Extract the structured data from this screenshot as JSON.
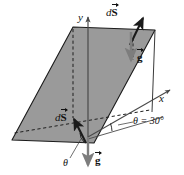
{
  "figure": {
    "type": "physics-vector-diagram",
    "background_color": "#ffffff",
    "plane_fill_color": "#9a9a9a",
    "plane_edge_color": "#1a1a1a",
    "gravity_arrow_color": "#7d7d7d",
    "normal_arrow_color": "#1a1a1a",
    "axis_color": "#4a4a4a"
  },
  "axes": {
    "y_label": "y",
    "x_label": "x"
  },
  "labels": {
    "ds_top": {
      "prefix": "d",
      "symbol": "S"
    },
    "ds_bottom": {
      "prefix": "d",
      "symbol": "S"
    },
    "g_top": {
      "symbol": "g"
    },
    "g_bottom": {
      "symbol": "g"
    },
    "theta_inner": "θ",
    "theta_value": "θ = 30°"
  },
  "geometry": {
    "plane_vertices": [
      [
        12,
        140
      ],
      [
        73,
        27
      ],
      [
        155,
        30
      ],
      [
        94,
        143
      ]
    ],
    "origin": [
      88,
      137
    ],
    "angle_degrees": 30
  }
}
